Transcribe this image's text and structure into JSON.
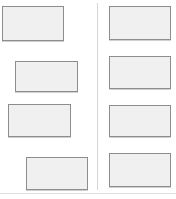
{
  "page": {
    "width": 176,
    "height": 199,
    "background_color": "#ffffff"
  },
  "theme": {
    "box_fill_color": "#f0f0f0",
    "box_border_color": "#8d8d8d",
    "divider_color": "#d6d6d6",
    "rule_color": "#e2e2e2"
  },
  "divider": {
    "name": "column-divider",
    "x": 97,
    "y": 3,
    "height": 187
  },
  "footer_rule": {
    "name": "footer-rule",
    "x": 0,
    "y": 193,
    "width": 176
  },
  "left_column": {
    "name": "left-column",
    "boxes": [
      {
        "label": "",
        "x": 2,
        "y": 6,
        "width": 62,
        "height": 35
      },
      {
        "label": "",
        "x": 15,
        "y": 61,
        "width": 63,
        "height": 31
      },
      {
        "label": "",
        "x": 8,
        "y": 104,
        "width": 63,
        "height": 33
      },
      {
        "label": "",
        "x": 26,
        "y": 157,
        "width": 62,
        "height": 33
      }
    ]
  },
  "right_column": {
    "name": "right-column",
    "boxes": [
      {
        "label": "",
        "x": 109,
        "y": 6,
        "width": 62,
        "height": 34
      },
      {
        "label": "",
        "x": 109,
        "y": 56,
        "width": 62,
        "height": 33
      },
      {
        "label": "",
        "x": 109,
        "y": 105,
        "width": 62,
        "height": 32
      },
      {
        "label": "",
        "x": 109,
        "y": 153,
        "width": 62,
        "height": 34
      }
    ]
  }
}
